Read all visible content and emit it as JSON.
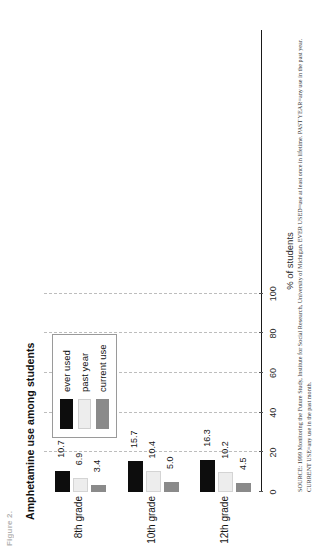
{
  "figure": {
    "number_label": "Figure 2.",
    "title": "Amphetamine use among students",
    "source_note": "SOURCE: 1999 Monitoring the Future Study, Institute for Social Research, University of Michigan. EVER USED=use at least once in lifetime. PAST YEAR=any use in the past year. CURRENT USE=any use in the past month."
  },
  "legend": {
    "items": [
      {
        "label": "ever used",
        "color": "#0d0d0d",
        "key": "ever"
      },
      {
        "label": "past year",
        "color": "#ededed",
        "key": "past"
      },
      {
        "label": "current use",
        "color": "#8a8a8a",
        "key": "current"
      }
    ]
  },
  "chart_data": {
    "type": "bar",
    "title": "Amphetamine use among students",
    "orientation": "vertical-rotated",
    "categories": [
      "8th grade",
      "10th grade",
      "12th grade"
    ],
    "series": [
      {
        "name": "ever used",
        "color": "#0d0d0d",
        "values": [
          10.7,
          15.7,
          16.3
        ]
      },
      {
        "name": "past year",
        "color": "#ededed",
        "values": [
          6.9,
          10.4,
          10.2
        ]
      },
      {
        "name": "current use",
        "color": "#8a8a8a",
        "values": [
          3.4,
          5.0,
          4.5
        ]
      }
    ],
    "xlabel": "",
    "ylabel": "% of students",
    "ylim": [
      0,
      110
    ],
    "yticks": [
      0,
      20,
      40,
      60,
      80,
      100
    ],
    "ytick_labels": [
      "0",
      "20",
      "40",
      "60",
      "80",
      "100"
    ],
    "grid": "dashed-vertical-at-ticks",
    "legend_position": "top-center",
    "data_labels": [
      "10.7",
      "6.9",
      "3.4",
      "15.7",
      "10.4",
      "5.0",
      "16.3",
      "10.2",
      "4.5"
    ]
  }
}
